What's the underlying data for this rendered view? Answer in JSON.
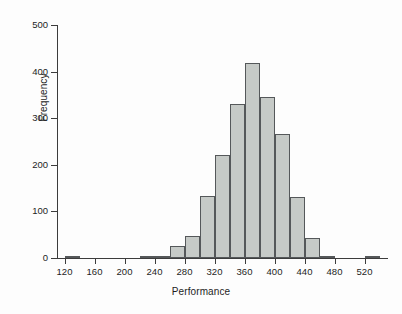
{
  "chart_data": {
    "type": "bar",
    "title": "",
    "xlabel": "Performance",
    "ylabel": "Frequency",
    "xlim": [
      110,
      550
    ],
    "ylim": [
      0,
      500
    ],
    "grid": false,
    "legend": null,
    "bin_width": 20,
    "x_ticks": [
      120,
      160,
      200,
      240,
      280,
      320,
      360,
      400,
      440,
      480,
      520
    ],
    "y_ticks": [
      0,
      100,
      200,
      300,
      400,
      500
    ],
    "categories": [
      "120-140",
      "140-160",
      "160-180",
      "180-200",
      "200-220",
      "220-240",
      "240-260",
      "260-280",
      "280-300",
      "300-320",
      "320-340",
      "340-360",
      "360-380",
      "380-400",
      "400-420",
      "420-440",
      "440-460",
      "460-480",
      "480-500",
      "500-520",
      "520-540"
    ],
    "bin_starts": [
      120,
      140,
      160,
      180,
      200,
      220,
      240,
      260,
      280,
      300,
      320,
      340,
      360,
      380,
      400,
      420,
      440,
      460,
      480,
      500,
      520
    ],
    "values": [
      3,
      0,
      0,
      0,
      0,
      5,
      2,
      26,
      47,
      134,
      222,
      330,
      419,
      346,
      267,
      130,
      43,
      5,
      0,
      0,
      4
    ],
    "colors": {
      "bar_fill": "#c6cac7",
      "bar_edge": "#55585a",
      "axis": "#3c3c3c",
      "text": "#1e1e1e",
      "background": "#fdfdfd"
    }
  },
  "axes": {
    "ylabel_text": "Frequency",
    "xlabel_text": "Performance",
    "ytick_labels": [
      "500",
      "400",
      "300",
      "200",
      "100",
      "0"
    ],
    "xtick_labels": [
      "120",
      "160",
      "200",
      "240",
      "280",
      "320",
      "360",
      "400",
      "440",
      "480",
      "520"
    ]
  }
}
